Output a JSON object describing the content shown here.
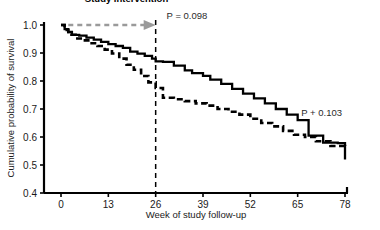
{
  "chart_data": {
    "type": "line",
    "title": "",
    "xlabel": "Week of study follow-up",
    "ylabel": "Cumulative probability of survival",
    "xlim": [
      0,
      80
    ],
    "ylim": [
      0.4,
      1.0
    ],
    "xticks": [
      "0",
      "13",
      "26",
      "39",
      "52",
      "65",
      "78"
    ],
    "xtick_values": [
      0,
      13,
      26,
      39,
      52,
      65,
      78
    ],
    "yticks": [
      "1.0",
      "0.9",
      "0.8",
      "0.7",
      "0.6",
      "0.5",
      "0.4"
    ],
    "ytick_values": [
      1.0,
      0.9,
      0.8,
      0.7,
      0.6,
      0.5,
      0.4
    ],
    "grid": false,
    "legend_position": "none",
    "series": [
      {
        "name": "solid-curve",
        "style": "solid",
        "color": "#000000",
        "step": "post",
        "x": [
          0,
          1,
          2,
          3,
          5,
          7,
          9,
          11,
          13,
          15,
          17,
          19,
          21,
          23,
          25,
          26,
          28,
          31,
          34,
          36,
          39,
          41,
          44,
          47,
          50,
          53,
          56,
          59,
          62,
          65,
          68,
          72,
          76,
          78
        ],
        "y": [
          1.0,
          0.985,
          0.975,
          0.965,
          0.962,
          0.955,
          0.948,
          0.94,
          0.932,
          0.925,
          0.918,
          0.905,
          0.898,
          0.89,
          0.88,
          0.87,
          0.868,
          0.855,
          0.838,
          0.828,
          0.818,
          0.805,
          0.79,
          0.772,
          0.755,
          0.738,
          0.72,
          0.7,
          0.68,
          0.66,
          0.605,
          0.58,
          0.578,
          0.52
        ]
      },
      {
        "name": "dashed-curve",
        "style": "dashed",
        "color": "#000000",
        "step": "post",
        "x": [
          0,
          1,
          2,
          4,
          6,
          8,
          10,
          12,
          14,
          16,
          18,
          20,
          22,
          24,
          26,
          28,
          31,
          34,
          37,
          40,
          43,
          46,
          49,
          52,
          55,
          58,
          61,
          64,
          67,
          70,
          74,
          78
        ],
        "y": [
          1.0,
          0.982,
          0.965,
          0.952,
          0.945,
          0.935,
          0.925,
          0.912,
          0.898,
          0.88,
          0.858,
          0.84,
          0.818,
          0.795,
          0.775,
          0.74,
          0.735,
          0.728,
          0.72,
          0.712,
          0.7,
          0.69,
          0.68,
          0.665,
          0.65,
          0.638,
          0.622,
          0.608,
          0.6,
          0.585,
          0.568,
          0.565
        ]
      }
    ],
    "annotations": [
      {
        "name": "study-intervention-label",
        "text": "Study intervention",
        "x_week": 18,
        "y_value": 1.06,
        "bold": true
      },
      {
        "name": "p-value-top",
        "text": "P = 0.098",
        "x_week": 29,
        "y_value": 1.0
      },
      {
        "name": "p-value-right",
        "text": "P + 0.103",
        "x_week": 66,
        "y_value": 0.655
      }
    ],
    "reference_lines": [
      {
        "name": "intervention-week-line",
        "orientation": "vertical",
        "x_week": 26,
        "style": "dashed",
        "color": "#000000"
      }
    ],
    "arrows": [
      {
        "name": "intervention-arrow",
        "from_week": 2,
        "to_week": 26,
        "y_value": 1.0,
        "style": "dashed",
        "color": "#9a9a9a"
      }
    ]
  }
}
